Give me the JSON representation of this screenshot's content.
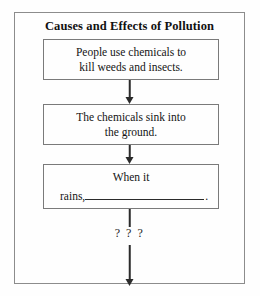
{
  "worksheet": {
    "title": "Causes and Effects of Pollution"
  },
  "flowchart": {
    "boxes": [
      {
        "id": "box-1",
        "lines": [
          "People use chemicals to",
          "kill weeds and insects."
        ]
      },
      {
        "id": "box-2",
        "lines": [
          "The chemicals sink into",
          "the ground."
        ]
      },
      {
        "id": "box-3",
        "lines": [
          "When it"
        ],
        "blank_prefix": "rains,",
        "blank_suffix": "."
      }
    ],
    "unknown_label": "? ? ?"
  }
}
